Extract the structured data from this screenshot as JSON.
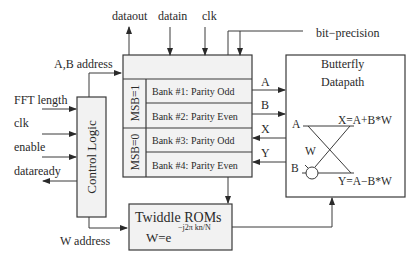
{
  "diagram": {
    "top_signals": {
      "dataout": "dataout",
      "datain": "datain",
      "clk": "clk",
      "bit_precision": "bit−precision"
    },
    "left_signals": {
      "ab_address": "A,B address",
      "fft_length": "FFT length",
      "clk": "clk",
      "enable": "enable",
      "dataready": "dataready",
      "w_address": "W address"
    },
    "control_logic": {
      "label": "Control Logic"
    },
    "memory": {
      "msb1": "MSB=1",
      "msb0": "MSB=0",
      "banks": [
        "Bank #1: Parity Odd",
        "Bank #2: Parity Even",
        "Bank #3: Parity Odd",
        "Bank #4: Parity Even"
      ]
    },
    "connections": {
      "a": "A",
      "b": "B",
      "x": "X",
      "y": "Y"
    },
    "butterfly": {
      "title_line1": "Butterfly",
      "title_line2": "Datapath",
      "in_a": "A",
      "in_b": "B",
      "w": "W",
      "x_eq": "X=A+B*W",
      "y_eq": "Y=A−B*W"
    },
    "twiddle": {
      "title": "Twiddle ROMs",
      "formula_base": "W=e",
      "formula_exp": "−j2π kn/N"
    },
    "colors": {
      "stroke": "#3a3a3a",
      "fill": "#f2f2f2",
      "background": "#ffffff"
    }
  }
}
